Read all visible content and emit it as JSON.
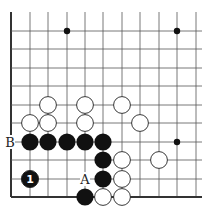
{
  "diagram": {
    "type": "go-board-problem",
    "grid": {
      "columns_x": [
        11,
        30,
        48,
        67,
        85,
        103,
        122,
        140,
        159,
        177,
        196
      ],
      "rows_y": [
        12,
        31,
        49,
        68,
        86,
        105,
        123,
        142,
        160,
        179,
        197
      ],
      "left_edge": true,
      "bottom_edge": true
    },
    "hoshi": [
      [
        67,
        31
      ],
      [
        177,
        31
      ],
      [
        177,
        142
      ]
    ],
    "white_stones": [
      [
        48,
        105
      ],
      [
        85,
        105
      ],
      [
        122,
        105
      ],
      [
        30,
        123
      ],
      [
        48,
        123
      ],
      [
        85,
        123
      ],
      [
        140,
        123
      ],
      [
        122,
        160
      ],
      [
        159,
        160
      ],
      [
        122,
        179
      ],
      [
        103,
        197
      ],
      [
        122,
        197
      ]
    ],
    "black_stones": [
      [
        30,
        142
      ],
      [
        48,
        142
      ],
      [
        67,
        142
      ],
      [
        85,
        142
      ],
      [
        103,
        142
      ],
      [
        103,
        160
      ],
      [
        103,
        179
      ],
      [
        85,
        197
      ]
    ],
    "numbered_stones": [
      {
        "x": 30,
        "y": 179,
        "color": "black",
        "number": "1"
      }
    ],
    "labels": [
      {
        "x": 10,
        "y": 142,
        "text": "B"
      },
      {
        "x": 85,
        "y": 179,
        "text": "A"
      }
    ],
    "colors": {
      "line": "#555555",
      "edge": "#333333",
      "black": "#111111",
      "white": "#ffffff"
    }
  }
}
